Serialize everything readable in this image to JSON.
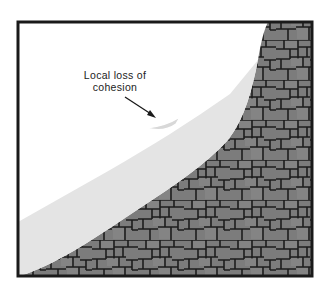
{
  "figure": {
    "type": "cross-section diagram",
    "annotation": {
      "line1": "Local loss of",
      "line2": "cohesion"
    },
    "layers": [
      {
        "name": "air",
        "color": "#ffffff"
      },
      {
        "name": "soil",
        "color": "#e4e4e4"
      },
      {
        "name": "jointed-rock",
        "color": "#7c7c7c",
        "joint_color": "#1c1c1c"
      }
    ],
    "frame_color": "#1a1a1a"
  }
}
